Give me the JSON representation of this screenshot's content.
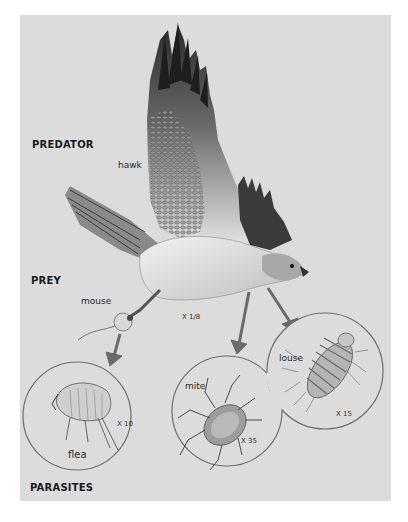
{
  "sections": {
    "predator": "PREDATOR",
    "prey": "PREY",
    "parasites": "PARASITES"
  },
  "organisms": {
    "hawk": {
      "name": "hawk",
      "scale": "X 1/8"
    },
    "mouse": {
      "name": "mouse"
    },
    "flea": {
      "name": "flea",
      "scale": "X 10"
    },
    "mite": {
      "name": "mite",
      "scale": "X 35"
    },
    "louse": {
      "name": "louse",
      "scale": "X 15"
    }
  },
  "colors": {
    "background": "#ffffff",
    "panel": "#dcdcdc",
    "arrow": "#6a6a6a",
    "circle_outline": "#6e6e6e"
  }
}
